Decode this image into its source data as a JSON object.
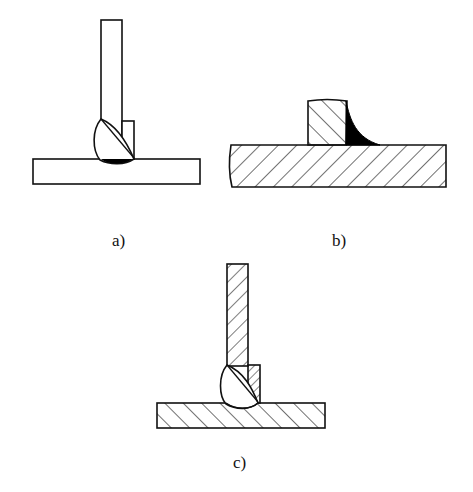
{
  "figure": {
    "panels": [
      {
        "id": "a",
        "label": "a)",
        "description": "T-joint with single-sided weld bead and backing strip, unhatched"
      },
      {
        "id": "b",
        "label": "b)",
        "description": "Hatched section: upright block on base plate with black fillet weld on right side"
      },
      {
        "id": "c",
        "label": "c)",
        "description": "Hatched T-joint with weld bead and hatched backing strip"
      }
    ],
    "colors": {
      "stroke": "#111111",
      "fill_weld_root": "#000000",
      "background": "#ffffff"
    }
  }
}
